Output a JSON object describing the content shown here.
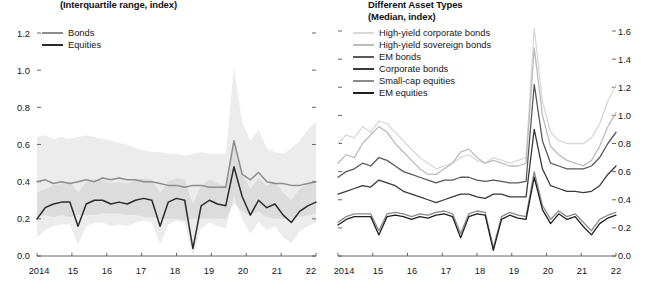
{
  "left_panel": {
    "subtitle": "(Interquartile range, index)",
    "legend": [
      {
        "label": "Bonds",
        "color": "#8c8c8c"
      },
      {
        "label": "Equities",
        "color": "#2b2b2b"
      }
    ],
    "y_ticks": [
      "0.0",
      "0.2",
      "0.4",
      "0.6",
      "0.8",
      "1.0",
      "1.2"
    ],
    "x_ticks": [
      "2014",
      "15",
      "16",
      "17",
      "18",
      "19",
      "20",
      "21",
      "22"
    ]
  },
  "right_panel": {
    "subtitle_line1": "Different Asset Types",
    "subtitle_line2": "(Median, index)",
    "legend": [
      {
        "label": "High-yield corporate bonds",
        "color": "#d8d8d8"
      },
      {
        "label": "High-yield sovereign bonds",
        "color": "#bcbcbc"
      },
      {
        "label": "EM bonds",
        "color": "#5a5a5a"
      },
      {
        "label": "Corporate bonds",
        "color": "#3a3a3a"
      },
      {
        "label": "Small-cap equities",
        "color": "#8a8a8a"
      },
      {
        "label": "EM equities",
        "color": "#1f1f1f"
      }
    ],
    "y_ticks": [
      "0.0",
      "0.2",
      "0.4",
      "0.6",
      "0.8",
      "1.0",
      "1.2",
      "1.4",
      "1.6"
    ],
    "x_ticks": [
      "2014",
      "15",
      "16",
      "17",
      "18",
      "19",
      "20",
      "21",
      "22"
    ]
  },
  "chart_data": [
    {
      "type": "area",
      "panel": "left",
      "title": "(Interquartile range, index)",
      "xlabel": "",
      "ylabel": "index",
      "ylim": [
        0.0,
        1.2
      ],
      "xlim": [
        2014.0,
        2022.5
      ],
      "grid": false,
      "legend_position": "top-left",
      "x": [
        2014.0,
        2014.25,
        2014.5,
        2014.75,
        2015.0,
        2015.25,
        2015.5,
        2015.75,
        2016.0,
        2016.25,
        2016.5,
        2016.75,
        2017.0,
        2017.25,
        2017.5,
        2017.75,
        2018.0,
        2018.25,
        2018.5,
        2018.75,
        2019.0,
        2019.25,
        2019.5,
        2019.75,
        2020.0,
        2020.25,
        2020.5,
        2020.75,
        2021.0,
        2021.25,
        2021.5,
        2021.75,
        2022.0,
        2022.25,
        2022.5
      ],
      "series": [
        {
          "name": "Bonds",
          "color": "#8c8c8c",
          "values": [
            0.4,
            0.41,
            0.39,
            0.4,
            0.39,
            0.4,
            0.41,
            0.4,
            0.42,
            0.41,
            0.42,
            0.41,
            0.41,
            0.4,
            0.4,
            0.39,
            0.38,
            0.38,
            0.37,
            0.38,
            0.38,
            0.37,
            0.37,
            0.37,
            0.62,
            0.44,
            0.41,
            0.45,
            0.4,
            0.39,
            0.39,
            0.38,
            0.38,
            0.39,
            0.4
          ],
          "band_upper": [
            0.64,
            0.65,
            0.63,
            0.64,
            0.63,
            0.64,
            0.65,
            0.64,
            0.63,
            0.62,
            0.61,
            0.6,
            0.58,
            0.57,
            0.56,
            0.56,
            0.55,
            0.55,
            0.54,
            0.55,
            0.56,
            0.55,
            0.55,
            0.55,
            1.02,
            0.72,
            0.62,
            0.68,
            0.58,
            0.56,
            0.55,
            0.58,
            0.62,
            0.68,
            0.72
          ],
          "band_lower": [
            0.21,
            0.22,
            0.21,
            0.22,
            0.21,
            0.22,
            0.22,
            0.22,
            0.23,
            0.23,
            0.23,
            0.22,
            0.22,
            0.21,
            0.21,
            0.2,
            0.2,
            0.2,
            0.19,
            0.2,
            0.2,
            0.2,
            0.2,
            0.2,
            0.28,
            0.24,
            0.22,
            0.24,
            0.21,
            0.2,
            0.2,
            0.2,
            0.21,
            0.22,
            0.23
          ]
        },
        {
          "name": "Equities",
          "color": "#2b2b2b",
          "values": [
            0.2,
            0.26,
            0.28,
            0.29,
            0.29,
            0.16,
            0.28,
            0.3,
            0.3,
            0.28,
            0.29,
            0.28,
            0.3,
            0.31,
            0.3,
            0.16,
            0.29,
            0.31,
            0.3,
            0.04,
            0.27,
            0.3,
            0.28,
            0.27,
            0.48,
            0.32,
            0.22,
            0.3,
            0.26,
            0.28,
            0.22,
            0.18,
            0.24,
            0.27,
            0.29
          ],
          "band_upper": [
            0.34,
            0.36,
            0.38,
            0.39,
            0.4,
            0.34,
            0.4,
            0.41,
            0.41,
            0.39,
            0.4,
            0.39,
            0.41,
            0.42,
            0.41,
            0.34,
            0.4,
            0.42,
            0.41,
            0.28,
            0.38,
            0.41,
            0.39,
            0.38,
            0.6,
            0.44,
            0.36,
            0.42,
            0.38,
            0.4,
            0.34,
            0.3,
            0.36,
            0.39,
            0.41
          ],
          "band_lower": [
            0.1,
            0.14,
            0.16,
            0.17,
            0.17,
            0.06,
            0.16,
            0.18,
            0.18,
            0.16,
            0.17,
            0.16,
            0.18,
            0.19,
            0.18,
            0.06,
            0.17,
            0.19,
            0.18,
            0.0,
            0.15,
            0.18,
            0.16,
            0.15,
            0.32,
            0.2,
            0.12,
            0.18,
            0.14,
            0.16,
            0.1,
            0.07,
            0.13,
            0.16,
            0.18
          ]
        }
      ]
    },
    {
      "type": "line",
      "panel": "right",
      "title": "Different Asset Types (Median, index)",
      "xlabel": "",
      "ylabel": "index",
      "ylim": [
        0.0,
        1.6
      ],
      "xlim": [
        2014.0,
        2022.5
      ],
      "grid": false,
      "legend_position": "top-left",
      "x": [
        2014.0,
        2014.25,
        2014.5,
        2014.75,
        2015.0,
        2015.25,
        2015.5,
        2015.75,
        2016.0,
        2016.25,
        2016.5,
        2016.75,
        2017.0,
        2017.25,
        2017.5,
        2017.75,
        2018.0,
        2018.25,
        2018.5,
        2018.75,
        2019.0,
        2019.25,
        2019.5,
        2019.75,
        2020.0,
        2020.25,
        2020.5,
        2020.75,
        2021.0,
        2021.25,
        2021.5,
        2021.75,
        2022.0,
        2022.25,
        2022.5
      ],
      "series": [
        {
          "name": "High-yield corporate bonds",
          "color": "#d8d8d8",
          "values": [
            0.8,
            0.86,
            0.84,
            0.92,
            0.88,
            0.96,
            0.94,
            0.88,
            0.82,
            0.76,
            0.7,
            0.66,
            0.62,
            0.64,
            0.66,
            0.7,
            0.72,
            0.68,
            0.66,
            0.7,
            0.68,
            0.66,
            0.68,
            0.7,
            1.62,
            1.1,
            0.88,
            0.82,
            0.8,
            0.8,
            0.8,
            0.84,
            0.94,
            1.1,
            1.22
          ]
        },
        {
          "name": "High-yield sovereign bonds",
          "color": "#bcbcbc",
          "values": [
            0.66,
            0.72,
            0.7,
            0.8,
            0.86,
            0.92,
            0.88,
            0.8,
            0.74,
            0.68,
            0.62,
            0.58,
            0.58,
            0.62,
            0.66,
            0.74,
            0.76,
            0.7,
            0.66,
            0.68,
            0.66,
            0.64,
            0.64,
            0.66,
            1.48,
            1.0,
            0.78,
            0.72,
            0.68,
            0.66,
            0.64,
            0.68,
            0.78,
            0.92,
            1.02
          ]
        },
        {
          "name": "EM bonds",
          "color": "#5a5a5a",
          "values": [
            0.56,
            0.6,
            0.62,
            0.66,
            0.64,
            0.7,
            0.68,
            0.64,
            0.6,
            0.58,
            0.56,
            0.54,
            0.52,
            0.54,
            0.54,
            0.56,
            0.56,
            0.54,
            0.53,
            0.54,
            0.53,
            0.52,
            0.52,
            0.53,
            1.22,
            0.82,
            0.66,
            0.64,
            0.62,
            0.62,
            0.62,
            0.64,
            0.7,
            0.8,
            0.88
          ]
        },
        {
          "name": "Corporate bonds",
          "color": "#3a3a3a",
          "values": [
            0.44,
            0.46,
            0.48,
            0.5,
            0.49,
            0.54,
            0.52,
            0.5,
            0.46,
            0.44,
            0.42,
            0.4,
            0.38,
            0.4,
            0.42,
            0.44,
            0.44,
            0.42,
            0.41,
            0.44,
            0.44,
            0.42,
            0.42,
            0.42,
            0.9,
            0.62,
            0.5,
            0.48,
            0.46,
            0.46,
            0.45,
            0.46,
            0.5,
            0.58,
            0.64
          ]
        },
        {
          "name": "Small-cap equities",
          "color": "#8a8a8a",
          "values": [
            0.24,
            0.28,
            0.3,
            0.3,
            0.3,
            0.18,
            0.3,
            0.31,
            0.3,
            0.28,
            0.3,
            0.29,
            0.31,
            0.32,
            0.3,
            0.16,
            0.3,
            0.32,
            0.31,
            0.06,
            0.28,
            0.31,
            0.29,
            0.28,
            0.6,
            0.36,
            0.26,
            0.32,
            0.28,
            0.3,
            0.24,
            0.18,
            0.26,
            0.29,
            0.31
          ]
        },
        {
          "name": "EM equities",
          "color": "#1f1f1f",
          "values": [
            0.22,
            0.26,
            0.28,
            0.28,
            0.28,
            0.15,
            0.28,
            0.29,
            0.28,
            0.26,
            0.28,
            0.27,
            0.29,
            0.3,
            0.28,
            0.13,
            0.28,
            0.3,
            0.29,
            0.04,
            0.26,
            0.29,
            0.27,
            0.26,
            0.56,
            0.33,
            0.23,
            0.3,
            0.26,
            0.28,
            0.21,
            0.15,
            0.23,
            0.27,
            0.29
          ]
        }
      ]
    }
  ]
}
